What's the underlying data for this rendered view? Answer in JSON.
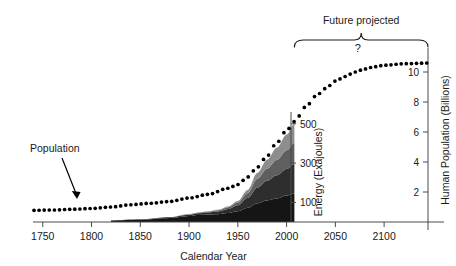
{
  "chart_data": {
    "type": "area",
    "title": "",
    "xlabel": "Calendar Year",
    "ylabel_left": "Energy (Exajoules)",
    "ylabel_right": "Human Population (Billions)",
    "xlim": [
      1740,
      2145
    ],
    "x_ticks": [
      1750,
      1800,
      1850,
      1900,
      1950,
      2000,
      2050,
      2100
    ],
    "x_tick_labels": [
      "1750",
      "1800",
      "1850",
      "1900",
      "1950",
      "2000",
      "2050",
      "2100"
    ],
    "energy_axis": {
      "label": "Energy (Exajoules)",
      "ticks": [
        100,
        300,
        500
      ],
      "tick_labels": [
        "100",
        "300",
        "500"
      ],
      "ylim": [
        0,
        560
      ],
      "position_year": 2008
    },
    "population_axis": {
      "label": "Human Population (Billions)",
      "ticks": [
        2,
        4,
        6,
        8,
        10
      ],
      "tick_labels": [
        "2",
        "4",
        "6",
        "8",
        "10"
      ],
      "ylim": [
        0,
        11.6
      ],
      "position_year": 2145
    },
    "grid": false,
    "legend_position": "none",
    "annotations": [
      {
        "name": "population-label",
        "text": "Population",
        "x": 1792,
        "y": 3.9
      },
      {
        "name": "future-projected-label",
        "text": "Future projected",
        "x": 2046,
        "y": 11.4
      },
      {
        "name": "question-mark",
        "text": "?",
        "x": 2073,
        "y": 10.05
      }
    ],
    "brace": {
      "name": "future-projected-brace",
      "x_start": 2008,
      "x_end": 2145
    },
    "series": [
      {
        "name": "Population",
        "style": "dotted-line",
        "axis": "right",
        "units": "billions",
        "x": [
          1740,
          1760,
          1780,
          1800,
          1820,
          1840,
          1860,
          1880,
          1900,
          1920,
          1940,
          1950,
          1960,
          1970,
          1980,
          1990,
          2000,
          2008,
          2020,
          2030,
          2040,
          2050,
          2060,
          2070,
          2080,
          2090,
          2100,
          2120,
          2145
        ],
        "values": [
          0.78,
          0.8,
          0.85,
          0.9,
          1.0,
          1.15,
          1.25,
          1.37,
          1.6,
          1.85,
          2.25,
          2.5,
          3.0,
          3.65,
          4.4,
          5.3,
          6.1,
          6.7,
          7.7,
          8.4,
          8.9,
          9.4,
          9.7,
          10.0,
          10.2,
          10.35,
          10.45,
          10.55,
          10.6
        ]
      },
      {
        "name": "Energy band 1 (darkest, bottom)",
        "style": "stacked-area",
        "axis": "left",
        "color": "#151515",
        "x": [
          1820,
          1850,
          1880,
          1900,
          1910,
          1920,
          1930,
          1940,
          1950,
          1960,
          1970,
          1980,
          1990,
          2000,
          2008
        ],
        "values": [
          8,
          12,
          20,
          30,
          36,
          38,
          40,
          46,
          55,
          72,
          95,
          110,
          120,
          135,
          145
        ]
      },
      {
        "name": "Energy band 2 (dark)",
        "style": "stacked-area",
        "axis": "left",
        "color": "#2e2e2e",
        "x": [
          1820,
          1850,
          1880,
          1900,
          1910,
          1920,
          1930,
          1940,
          1950,
          1960,
          1970,
          1980,
          1990,
          2000,
          2008
        ],
        "values": [
          1,
          2,
          4,
          7,
          9,
          11,
          14,
          20,
          30,
          50,
          80,
          100,
          118,
          135,
          150
        ]
      },
      {
        "name": "Energy band 3 (mid gray)",
        "style": "stacked-area",
        "axis": "left",
        "color": "#5f5f5f",
        "x": [
          1820,
          1850,
          1880,
          1900,
          1910,
          1920,
          1930,
          1940,
          1950,
          1960,
          1970,
          1980,
          1990,
          2000,
          2008
        ],
        "values": [
          0,
          0,
          1,
          2,
          3,
          4,
          6,
          9,
          14,
          25,
          45,
          62,
          78,
          95,
          108
        ]
      },
      {
        "name": "Energy band 4 (light gray, top)",
        "style": "stacked-area",
        "axis": "left",
        "color": "#8d8d8d",
        "x": [
          1820,
          1850,
          1880,
          1900,
          1910,
          1920,
          1930,
          1940,
          1950,
          1960,
          1970,
          1980,
          1990,
          2000,
          2008
        ],
        "values": [
          0,
          0,
          0,
          1,
          1,
          2,
          3,
          4,
          8,
          16,
          30,
          45,
          62,
          80,
          97
        ]
      }
    ]
  }
}
